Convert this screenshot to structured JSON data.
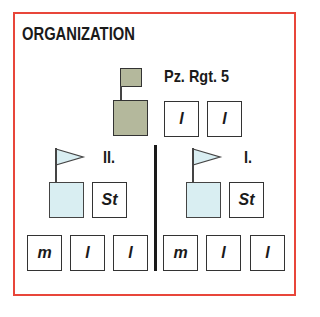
{
  "title": "ORGANIZATION",
  "colors": {
    "border": "#e8463a",
    "regiment_fill": "#b4b89c",
    "battalion_fill": "#d9eef2"
  },
  "regiment": {
    "label": "Pz. Rgt. 5",
    "icon": "square-flag-icon",
    "sub_units": [
      "l",
      "l"
    ]
  },
  "battalions": [
    {
      "label": "II.",
      "icon": "pennant-flag-icon",
      "staff": "St",
      "companies": [
        "m",
        "l",
        "l"
      ]
    },
    {
      "label": "I.",
      "icon": "pennant-flag-icon",
      "staff": "St",
      "companies": [
        "m",
        "l",
        "l"
      ]
    }
  ]
}
